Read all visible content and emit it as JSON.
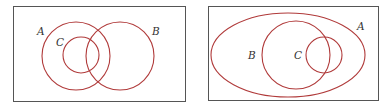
{
  "diagrams": [
    {
      "name": "venn-left",
      "labels": {
        "A": "A",
        "B": "B",
        "C": "C"
      }
    },
    {
      "name": "venn-right",
      "labels": {
        "A": "A",
        "B": "B",
        "C": "C"
      }
    }
  ],
  "colors": {
    "set_stroke": "#b03a3a",
    "box_stroke": "#555555"
  }
}
